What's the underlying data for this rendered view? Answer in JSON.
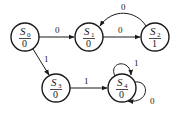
{
  "diagram": {
    "type": "moore-state-machine",
    "colors": {
      "stroke": "#1a1a1a",
      "fill": "#ffffff"
    },
    "states": [
      {
        "id": "S0",
        "name": "S",
        "sub": "0",
        "output": "0",
        "cx": 25,
        "cy": 37
      },
      {
        "id": "S1",
        "name": "S",
        "sub": "1",
        "output": "0",
        "cx": 89,
        "cy": 37
      },
      {
        "id": "S2",
        "name": "S",
        "sub": "2",
        "output": "1",
        "cx": 155,
        "cy": 37
      },
      {
        "id": "S3",
        "name": "S",
        "sub": "3",
        "output": "0",
        "cx": 56,
        "cy": 88
      },
      {
        "id": "S4",
        "name": "S",
        "sub": "4",
        "output": "0",
        "cx": 122,
        "cy": 88
      }
    ],
    "transitions": [
      {
        "from": "S0",
        "to": "S1",
        "input": "0"
      },
      {
        "from": "S1",
        "to": "S2",
        "input": "0"
      },
      {
        "from": "S2",
        "to": "S1",
        "input": "0"
      },
      {
        "from": "S0",
        "to": "S3",
        "input": "1"
      },
      {
        "from": "S3",
        "to": "S4",
        "input": "1"
      },
      {
        "from": "S4",
        "to": "S4",
        "input": "1"
      },
      {
        "from": "S4",
        "to": "S4",
        "input": "0"
      }
    ]
  }
}
